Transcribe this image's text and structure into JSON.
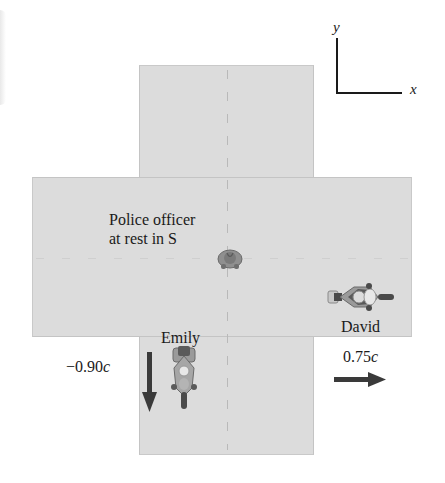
{
  "axes": {
    "y_label": "y",
    "x_label": "x"
  },
  "officer": {
    "label_line1": "Police officer",
    "label_line2": "at rest in S"
  },
  "emily": {
    "name": "Emily",
    "velocity_value": "−0.90",
    "velocity_unit": "c",
    "direction": "down"
  },
  "david": {
    "name": "David",
    "velocity_value": "0.75",
    "velocity_unit": "c",
    "direction": "right"
  },
  "colors": {
    "road": "#dcdcdc",
    "arrow": "#3a3a3a",
    "bike_body": "#9a9a9a",
    "bike_dark": "#4a4a4a"
  }
}
